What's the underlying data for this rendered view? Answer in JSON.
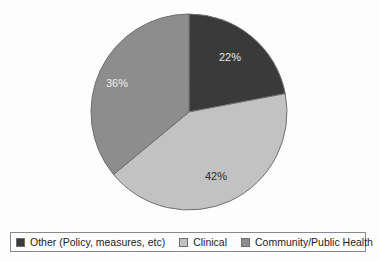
{
  "chart_data": {
    "type": "pie",
    "title": "",
    "labels": [
      "Other (Policy, measures, etc)",
      "Clinical",
      "Community/Public Health"
    ],
    "values": [
      22,
      42,
      36
    ],
    "value_labels": [
      "22%",
      "42%",
      "36%"
    ],
    "units": "percent",
    "start_angle_deg": 0,
    "direction": "clockwise",
    "legend_position": "bottom",
    "grid": false,
    "colors": [
      "#3a3a3a",
      "#c2c2c2",
      "#8d8d8d"
    ],
    "slices": [
      {
        "label": "Other (Policy, measures, etc)",
        "value": 22,
        "value_label": "22%",
        "color": "#3a3a3a",
        "label_color": "#e8e8e8"
      },
      {
        "label": "Clinical",
        "value": 42,
        "value_label": "42%",
        "color": "#c2c2c2",
        "label_color": "#2a2a2a"
      },
      {
        "label": "Community/Public Health",
        "value": 36,
        "value_label": "36%",
        "color": "#8d8d8d",
        "label_color": "#f0f0f0"
      }
    ]
  },
  "pie": {
    "center_x": 189,
    "center_y": 112,
    "radius": 98,
    "outline_color": "#6f6f6f",
    "labels": [
      {
        "text": "22%",
        "x": 230,
        "y": 61,
        "color": "#e8e8e8"
      },
      {
        "text": "42%",
        "x": 216,
        "y": 180,
        "color": "#2a2a2a"
      },
      {
        "text": "36%",
        "x": 117,
        "y": 87,
        "color": "#f0f0f0"
      }
    ]
  },
  "legend": {
    "items": [
      {
        "label": "Other (Policy, measures, etc)",
        "color": "#3a3a3a"
      },
      {
        "label": "Clinical",
        "color": "#c2c2c2"
      },
      {
        "label": "Community/Public Health",
        "color": "#8d8d8d"
      }
    ]
  }
}
